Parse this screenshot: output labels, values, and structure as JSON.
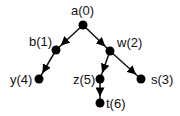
{
  "diagram": {
    "type": "tree",
    "nodes": [
      {
        "id": "a",
        "label": "a(0)",
        "x": 83,
        "y": 25,
        "label_x": 71,
        "label_y": 15
      },
      {
        "id": "b",
        "label": "b(1)",
        "x": 56,
        "y": 50,
        "label_x": 29,
        "label_y": 46
      },
      {
        "id": "w",
        "label": "w(2)",
        "x": 110,
        "y": 51,
        "label_x": 117,
        "label_y": 47
      },
      {
        "id": "y",
        "label": "y(4)",
        "x": 39,
        "y": 79,
        "label_x": 10,
        "label_y": 84
      },
      {
        "id": "z",
        "label": "z(5)",
        "x": 100,
        "y": 79,
        "label_x": 73,
        "label_y": 84
      },
      {
        "id": "s",
        "label": "s(3)",
        "x": 141,
        "y": 79,
        "label_x": 151,
        "label_y": 84
      },
      {
        "id": "t",
        "label": "t(6)",
        "x": 100,
        "y": 103,
        "label_x": 106,
        "label_y": 108
      }
    ],
    "edges": [
      {
        "from": "a",
        "to": "b"
      },
      {
        "from": "a",
        "to": "w"
      },
      {
        "from": "b",
        "to": "y"
      },
      {
        "from": "w",
        "to": "z"
      },
      {
        "from": "w",
        "to": "s"
      },
      {
        "from": "z",
        "to": "t"
      }
    ]
  }
}
